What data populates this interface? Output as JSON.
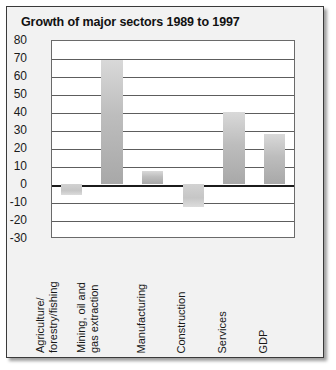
{
  "chart_data": {
    "type": "bar",
    "title": "Growth of major sectors 1989 to 1997",
    "xlabel": "",
    "ylabel": "",
    "ylim": [
      -30,
      80
    ],
    "yticks": [
      80,
      70,
      60,
      50,
      40,
      30,
      20,
      10,
      0,
      -10,
      -20,
      -30
    ],
    "ytick_labels": [
      "80",
      "70",
      "60",
      "50",
      "40",
      "30",
      "20",
      "10",
      "0",
      "-10",
      "-20",
      "-30"
    ],
    "grid": true,
    "legend": false,
    "categories": [
      "Agriculture/\nforestry/fishing",
      "Mining, oil and\ngas extraction",
      "Manufacturing",
      "Construction",
      "Services",
      "GDP"
    ],
    "values": [
      -6,
      69,
      7,
      -13,
      40,
      28
    ],
    "bar_color": "#bdbdbd",
    "plot_background": "#ffffff",
    "figure_background": "#f2f2f2",
    "axis_color": "#5d5d5d",
    "zero_line_color": "#1b1b1b"
  }
}
